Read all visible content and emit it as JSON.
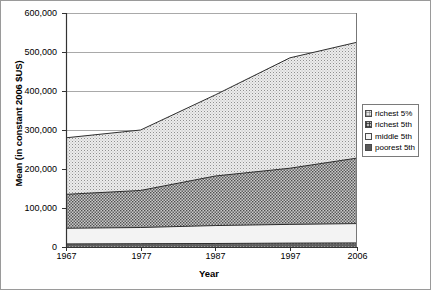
{
  "chart_data": {
    "type": "area",
    "stacked": true,
    "title": "",
    "xlabel": "Year",
    "ylabel": "Mean (in constant 2006 $US)",
    "x": [
      1967,
      1977,
      1987,
      1997,
      2006
    ],
    "xtick_labels": [
      "1967",
      "1977",
      "1987",
      "1997",
      "2006"
    ],
    "ytick_labels": [
      "600,000",
      "500,000",
      "400,000",
      "300,000",
      "200,000",
      "100,000",
      "0"
    ],
    "ytick_values": [
      600000,
      500000,
      400000,
      300000,
      200000,
      100000,
      0
    ],
    "ylim": [
      0,
      600000
    ],
    "xlim": [
      1967,
      2006
    ],
    "grid": "horizontal",
    "legend_position": "right",
    "series": [
      {
        "name": "poorest 5th",
        "swatch": "solid-dark",
        "color": "#5a5a5a",
        "values": [
          8000,
          8500,
          9000,
          10000,
          10500
        ]
      },
      {
        "name": "middle 5th",
        "swatch": "plain-light",
        "color": "#f2f2f2",
        "values": [
          40000,
          41500,
          46000,
          48000,
          49500
        ]
      },
      {
        "name": "richest 5th",
        "swatch": "dense-crosshatch",
        "color": "#bdbdbd",
        "values": [
          87000,
          95000,
          127000,
          144000,
          168000
        ]
      },
      {
        "name": "richest 5%",
        "swatch": "fine-dot-grid",
        "color": "#e8e8e8",
        "values": [
          145000,
          155000,
          208000,
          283000,
          297000
        ]
      }
    ],
    "cumulative_tops": [
      {
        "name": "poorest 5th",
        "values": [
          8000,
          8500,
          9000,
          10000,
          10500
        ]
      },
      {
        "name": "middle 5th",
        "values": [
          48000,
          50000,
          55000,
          58000,
          60000
        ]
      },
      {
        "name": "richest 5th",
        "values": [
          135000,
          145000,
          182000,
          202000,
          228000
        ]
      },
      {
        "name": "richest 5%",
        "values": [
          280000,
          300000,
          390000,
          485000,
          525000
        ]
      }
    ]
  },
  "legend": {
    "items": [
      {
        "label": "richest 5%"
      },
      {
        "label": "richest 5th"
      },
      {
        "label": "middle 5th"
      },
      {
        "label": "poorest 5th"
      }
    ]
  }
}
